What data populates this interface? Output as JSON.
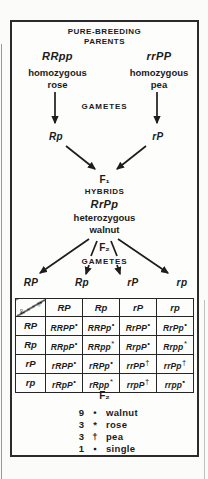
{
  "header": {
    "line1": "PURE-BREEDING",
    "line2": "PARENTS"
  },
  "parents": {
    "left": {
      "genotype": "RRpp",
      "desc1": "homozygous",
      "desc2": "rose"
    },
    "right": {
      "genotype": "rrPP",
      "desc1": "homozygous",
      "desc2": "pea"
    }
  },
  "gametes1": {
    "label": "GAMETES",
    "left": "Rp",
    "right": "rP"
  },
  "f1": {
    "label": "F₁",
    "caption": "HYBRIDS",
    "genotype": "RrPp",
    "desc1": "heterozygous",
    "desc2": "walnut"
  },
  "f2_top": {
    "label": "F₂",
    "caption": "GAMETES"
  },
  "gametes2": [
    "RP",
    "Rp",
    "rP",
    "rp"
  ],
  "punnett": {
    "corner": {
      "female": "♀",
      "male": "♂"
    },
    "col_headers": [
      "RP",
      "Rp",
      "rP",
      "rp"
    ],
    "rows": [
      {
        "header": "RP",
        "cells": [
          {
            "g": "RRPP",
            "s": "•"
          },
          {
            "g": "RRPp",
            "s": "•"
          },
          {
            "g": "RrPP",
            "s": "•"
          },
          {
            "g": "RrPp",
            "s": "•"
          }
        ]
      },
      {
        "header": "Rp",
        "cells": [
          {
            "g": "RRpP",
            "s": "•"
          },
          {
            "g": "RRpp",
            "s": "*"
          },
          {
            "g": "RrpP",
            "s": "•"
          },
          {
            "g": "Rrpp",
            "s": "*"
          }
        ]
      },
      {
        "header": "rP",
        "cells": [
          {
            "g": "rRPP",
            "s": "•"
          },
          {
            "g": "rRPp",
            "s": "•"
          },
          {
            "g": "rrPP",
            "s": "†"
          },
          {
            "g": "rrPp",
            "s": "†"
          }
        ]
      },
      {
        "header": "rp",
        "cells": [
          {
            "g": "rRpP",
            "s": "•"
          },
          {
            "g": "rRpp",
            "s": "*"
          },
          {
            "g": "rrpP",
            "s": "†"
          },
          {
            "g": "rrpp",
            "s": "▪"
          }
        ]
      }
    ]
  },
  "f2_bottom": {
    "label": "F₂"
  },
  "legend": {
    "items": [
      {
        "count": "9",
        "symbol": "•",
        "label": "walnut"
      },
      {
        "count": "3",
        "symbol": "*",
        "label": "rose"
      },
      {
        "count": "3",
        "symbol": "†",
        "label": "pea"
      },
      {
        "count": "1",
        "symbol": "▪",
        "label": "single"
      }
    ]
  },
  "colors": {
    "ink": "#1b1b1b",
    "paper": "#fdfdfc"
  }
}
